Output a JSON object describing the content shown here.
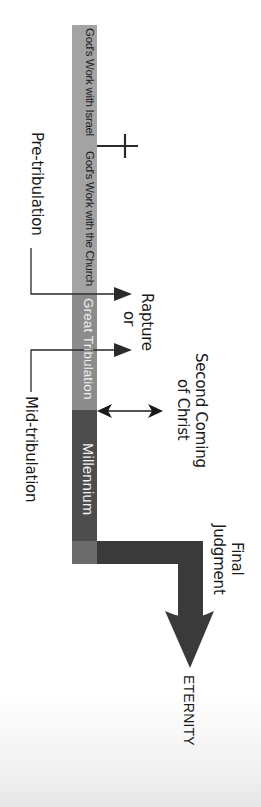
{
  "diagram": {
    "orientation": "vertical (text rotated 90° clockwise)",
    "timeline_segments": [
      {
        "label": "God's Work with Israel",
        "color": "#a3a3a3"
      },
      {
        "label": "God's Work with the Church",
        "color": "#a3a3a3"
      },
      {
        "label": "Great Tribulation",
        "color": "#8c8c8c"
      },
      {
        "label": "Millennium",
        "color": "#4d4d4d"
      }
    ],
    "markers": {
      "cross": "cross-icon",
      "pre_tribulation": "Pre-tribulation",
      "mid_tribulation": "Mid-tribulation",
      "rapture_line1": "Rapture",
      "rapture_line2": "or",
      "second_coming_line1": "Second Coming",
      "second_coming_line2": "of Christ",
      "final_judgment_line1": "Final",
      "final_judgment_line2": "Judgment",
      "eternity": "ETERNITY"
    },
    "colors": {
      "bar_light": "#a3a3a3",
      "bar_tribulation": "#8c8c8c",
      "bar_millennium": "#4d4d4d",
      "bar_endcap": "#6b6b6b",
      "judgment_arrow": "#3a3a3a",
      "lines": "#2a2a2a"
    }
  }
}
